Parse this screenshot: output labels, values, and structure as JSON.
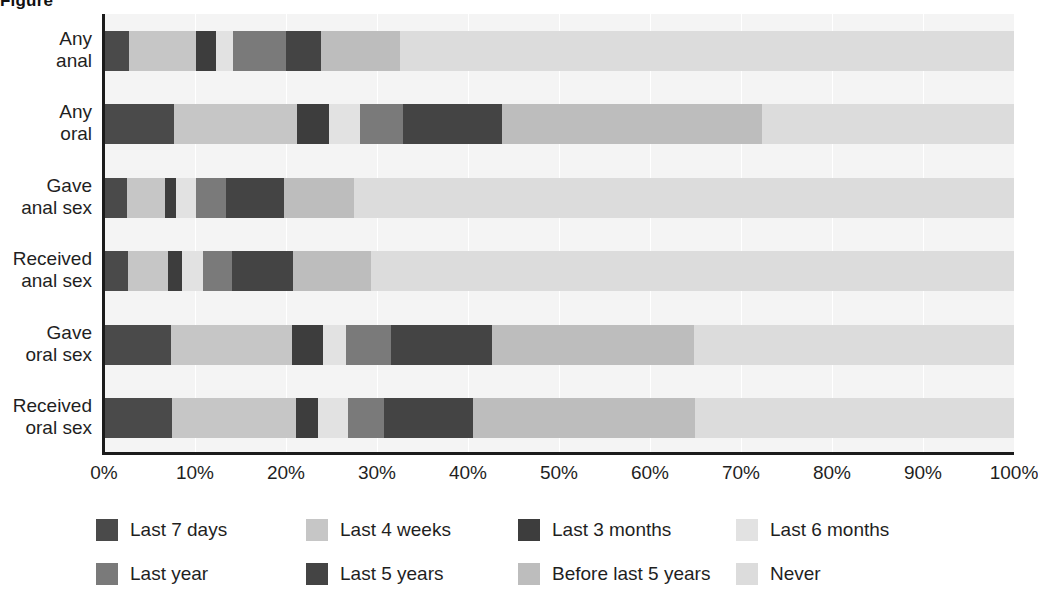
{
  "figure": {
    "title_clipped": "Figure"
  },
  "axis": {
    "x_ticks": [
      "0%",
      "10%",
      "20%",
      "30%",
      "40%",
      "50%",
      "60%",
      "70%",
      "80%",
      "90%",
      "100%"
    ],
    "x_tick_values": [
      0,
      10,
      20,
      30,
      40,
      50,
      60,
      70,
      80,
      90,
      100
    ],
    "y_labels": [
      {
        "line1": "Any",
        "line2": "anal"
      },
      {
        "line1": "Any",
        "line2": "oral"
      },
      {
        "line1": "Gave",
        "line2": "anal sex"
      },
      {
        "line1": "Received",
        "line2": "anal sex"
      },
      {
        "line1": "Gave",
        "line2": "oral sex"
      },
      {
        "line1": "Received",
        "line2": "oral sex"
      }
    ]
  },
  "legend": {
    "rows": [
      [
        {
          "label": "Last 7 days",
          "color": "#4a4a4a"
        },
        {
          "label": "Last 4 weeks",
          "color": "#c6c6c6"
        },
        {
          "label": "Last 3 months",
          "color": "#3d3d3d"
        },
        {
          "label": "Last 6 months",
          "color": "#e2e2e2"
        }
      ],
      [
        {
          "label": "Last year",
          "color": "#7a7a7a"
        },
        {
          "label": "Last 5 years",
          "color": "#444444"
        },
        {
          "label": "Before last 5 years",
          "color": "#bdbdbd"
        },
        {
          "label": "Never",
          "color": "#dcdcdc"
        }
      ]
    ]
  },
  "chart_data": {
    "type": "bar",
    "orientation": "horizontal",
    "stacked": true,
    "title": "",
    "xlabel": "",
    "ylabel": "",
    "xlim": [
      0,
      100
    ],
    "grid": true,
    "legend_position": "bottom",
    "categories": [
      "Any anal",
      "Any oral",
      "Gave anal sex",
      "Received anal sex",
      "Gave oral sex",
      "Received oral sex"
    ],
    "series": [
      {
        "name": "Last 7 days",
        "color": "#4a4a4a",
        "values": [
          2.8,
          7.7,
          2.5,
          2.6,
          7.4,
          7.5
        ]
      },
      {
        "name": "Last 4 weeks",
        "color": "#c6c6c6",
        "values": [
          7.3,
          13.5,
          4.2,
          4.4,
          13.3,
          13.6
        ]
      },
      {
        "name": "Last 3 months",
        "color": "#3d3d3d",
        "values": [
          2.2,
          3.5,
          1.2,
          1.6,
          3.4,
          2.4
        ]
      },
      {
        "name": "Last 6 months",
        "color": "#e2e2e2",
        "values": [
          1.9,
          3.4,
          2.2,
          2.3,
          2.5,
          3.3
        ]
      },
      {
        "name": "Last year",
        "color": "#7a7a7a",
        "values": [
          5.8,
          4.8,
          3.3,
          3.2,
          4.9,
          4.0
        ]
      },
      {
        "name": "Last 5 years",
        "color": "#444444",
        "values": [
          3.9,
          10.8,
          6.4,
          6.7,
          11.1,
          9.7
        ]
      },
      {
        "name": "Before last 5 years",
        "color": "#bdbdbd",
        "values": [
          8.6,
          28.6,
          7.7,
          8.6,
          22.2,
          24.5
        ]
      },
      {
        "name": "Never",
        "color": "#dcdcdc",
        "values": [
          67.5,
          27.7,
          72.5,
          70.6,
          35.2,
          35.0
        ]
      }
    ]
  }
}
